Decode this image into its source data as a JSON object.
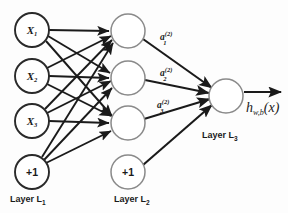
{
  "diagram": {
    "background_color": "#fdfdfd",
    "edge_color": "#1a1a1a",
    "input_node_stroke": "#2a2a2a",
    "hidden_node_stroke": "#8a8a8a"
  },
  "layers": [
    {
      "id": "L1",
      "label_text": "Layer L",
      "label_sub": "1",
      "label_x": 10,
      "label_y": 202,
      "node_x": 32,
      "node_radius": 17,
      "nodes": [
        {
          "name": "input-x1",
          "label_main": "X",
          "label_sub": "1",
          "cx": 32,
          "cy": 30,
          "style": "input"
        },
        {
          "name": "input-x2",
          "label_main": "X",
          "label_sub": "2",
          "cx": 32,
          "cy": 76,
          "style": "input"
        },
        {
          "name": "input-x3",
          "label_main": "X",
          "label_sub": "3",
          "cx": 32,
          "cy": 121,
          "style": "input"
        },
        {
          "name": "input-bias",
          "label_main": "+1",
          "label_sub": "",
          "cx": 32,
          "cy": 172,
          "style": "input"
        }
      ]
    },
    {
      "id": "L2",
      "label_text": "Layer L",
      "label_sub": "2",
      "label_x": 114,
      "label_y": 202,
      "node_x": 128,
      "node_radius": 17,
      "nodes": [
        {
          "name": "hidden-a1",
          "label_main": "",
          "label_sub": "",
          "cx": 128,
          "cy": 31,
          "style": "hidden"
        },
        {
          "name": "hidden-a2",
          "label_main": "",
          "label_sub": "",
          "cx": 128,
          "cy": 78,
          "style": "hidden"
        },
        {
          "name": "hidden-a3",
          "label_main": "",
          "label_sub": "",
          "cx": 128,
          "cy": 123,
          "style": "hidden"
        },
        {
          "name": "hidden-bias",
          "label_main": "+1",
          "label_sub": "",
          "cx": 128,
          "cy": 172,
          "style": "hidden"
        }
      ]
    },
    {
      "id": "L3",
      "label_text": "Layer L",
      "label_sub": "3",
      "label_x": 202,
      "label_y": 138,
      "node_x": 226,
      "node_radius": 17,
      "nodes": [
        {
          "name": "output-node",
          "label_main": "",
          "label_sub": "",
          "cx": 226,
          "cy": 96,
          "style": "hidden"
        }
      ]
    }
  ],
  "activation_labels": [
    {
      "name": "activation-a1",
      "base": "a",
      "sup": "(2)",
      "sub": "1",
      "x": 160,
      "y": 38
    },
    {
      "name": "activation-a2",
      "base": "a",
      "sup": "(2)",
      "sub": "2",
      "x": 160,
      "y": 74
    },
    {
      "name": "activation-a3",
      "base": "a",
      "sup": "(2)",
      "sub": "3",
      "x": 157,
      "y": 106
    },
    {
      "name": "output-expression",
      "base": "h",
      "sup": "",
      "sub": "w,b",
      "suffix": "(x)",
      "x": 248,
      "y": 112
    }
  ],
  "output_expression": {
    "base": "h",
    "sub": "w,b",
    "arg": "(x)"
  },
  "edges": {
    "input_to_hidden_count": 12,
    "hidden_to_output_count": 4,
    "output_arrow": true
  }
}
